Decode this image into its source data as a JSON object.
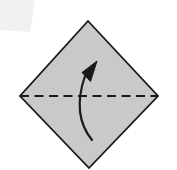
{
  "diagram": {
    "title": "Origami fold step diagram",
    "caption": "Square sheet rotated 45 degrees with horizontal valley fold line and upward fold arrow",
    "canvas": {
      "width": 177,
      "height": 170,
      "background_color": "#ffffff"
    },
    "paper": {
      "label": "paper-square",
      "shape": "diamond",
      "fill_color": "#c9c9c9",
      "stroke_color": "#1a1a1a",
      "stroke_width": 1.8,
      "points": "88,21 158,96 89,168 20,96",
      "vertices": [
        {
          "name": "top-corner",
          "x": 88,
          "y": 21
        },
        {
          "name": "right-corner",
          "x": 158,
          "y": 96
        },
        {
          "name": "bottom-corner",
          "x": 89,
          "y": 168
        },
        {
          "name": "left-corner",
          "x": 20,
          "y": 96
        }
      ]
    },
    "fold_line": {
      "label": "valley-fold-line",
      "style": "dashed",
      "color": "#1a1a1a",
      "stroke_width": 2.2,
      "dash_pattern": "9 5.5",
      "x1": 20,
      "y1": 96,
      "x2": 158,
      "y2": 96
    },
    "fold_arrow": {
      "label": "fold-up-arrow",
      "color": "#1a1a1a",
      "stroke_width": 2.2,
      "path": "M 92 140 C 79 124 76 102 85 76",
      "head_points": "97,61 90.5,81.5 82,72.5",
      "direction": "up",
      "start": {
        "x": 92,
        "y": 140
      },
      "tip": {
        "x": 97,
        "y": 61
      }
    },
    "corner_mark": {
      "label": "page-corner-smudge",
      "fill_color": "#f1f1f1",
      "points": "0,0 35,0 30,32 0,30"
    }
  }
}
